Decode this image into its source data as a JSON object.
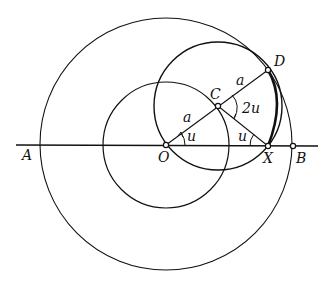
{
  "diagram": {
    "type": "geometric-construction",
    "points": {
      "A": {
        "label": "A"
      },
      "O": {
        "label": "O"
      },
      "C": {
        "label": "C"
      },
      "D": {
        "label": "D"
      },
      "X": {
        "label": "X"
      },
      "B": {
        "label": "B"
      }
    },
    "segment_labels": {
      "OC": "a",
      "CD": "a"
    },
    "angle_labels": {
      "at_O": "u",
      "at_X": "u",
      "at_C": "2u"
    },
    "colors": {
      "stroke": "#111111",
      "background": "#ffffff"
    }
  }
}
